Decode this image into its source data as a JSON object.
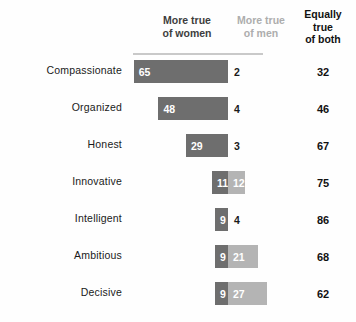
{
  "header": {
    "col_women": "More true\nof women",
    "col_women_line1": "More true",
    "col_women_line2": "of women",
    "col_men_line1": "More true",
    "col_men_line2": "of men",
    "col_both_line1": "Equally",
    "col_both_line2": "true",
    "col_both_line3": "of both"
  },
  "colors": {
    "women_bar": "#6e6e6e",
    "men_bar": "#b4b4b4",
    "women_header_text": "#3d3d3d",
    "men_header_text": "#adadad",
    "both_header_text": "#111111",
    "background": "#fefefe",
    "rule": "#c9c9c9"
  },
  "chart_data": {
    "type": "bar",
    "subtype": "diverging-stacked",
    "title": "",
    "xlabel": "",
    "ylabel": "",
    "categories": [
      "Compassionate",
      "Organized",
      "Honest",
      "Innovative",
      "Intelligent",
      "Ambitious",
      "Decisive"
    ],
    "series": [
      {
        "name": "More true of women",
        "color": "#6e6e6e",
        "values": [
          65,
          48,
          29,
          11,
          9,
          9,
          9
        ]
      },
      {
        "name": "More true of men",
        "color": "#b4b4b4",
        "values": [
          2,
          4,
          3,
          12,
          4,
          21,
          27
        ]
      },
      {
        "name": "Equally true of both",
        "color": "#111111",
        "values": [
          32,
          46,
          67,
          75,
          86,
          68,
          62
        ]
      }
    ],
    "legend_position": "top",
    "grid": false,
    "axis_center_label": "0",
    "units": "percent"
  },
  "rows": [
    {
      "label": "Compassionate",
      "women": 65,
      "men": 2,
      "men_inside": false,
      "both": 32
    },
    {
      "label": "Organized",
      "women": 48,
      "men": 4,
      "men_inside": false,
      "both": 46
    },
    {
      "label": "Honest",
      "women": 29,
      "men": 3,
      "men_inside": false,
      "both": 67
    },
    {
      "label": "Innovative",
      "women": 11,
      "men": 12,
      "men_inside": true,
      "both": 75
    },
    {
      "label": "Intelligent",
      "women": 9,
      "men": 4,
      "men_inside": false,
      "both": 86
    },
    {
      "label": "Ambitious",
      "women": 9,
      "men": 21,
      "men_inside": true,
      "both": 68
    },
    {
      "label": "Decisive",
      "women": 9,
      "men": 27,
      "men_inside": true,
      "both": 62
    }
  ]
}
